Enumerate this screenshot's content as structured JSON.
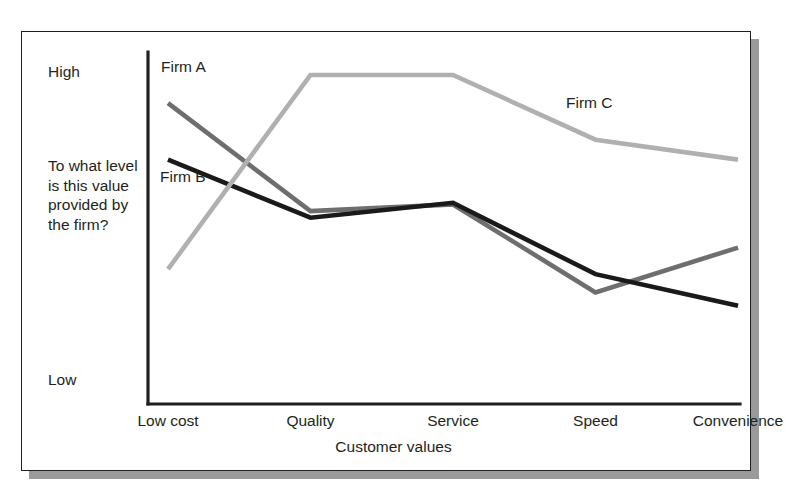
{
  "figure": {
    "background_color": "#ffffff",
    "frame_border_color": "#231f20",
    "frame_shadow_color": "#9a9a9a"
  },
  "chart_data": {
    "type": "line",
    "title": "",
    "subtitle": "",
    "xlabel": "Customer values",
    "ylabel": "To what level is this value provided by the firm?",
    "categories": [
      "Low cost",
      "Quality",
      "Service",
      "Speed",
      "Convenience"
    ],
    "y_tick_labels": [
      "High",
      "Low"
    ],
    "ylim": [
      0,
      10
    ],
    "grid": false,
    "legend_position": "inline-annotations",
    "series": [
      {
        "name": "Firm A",
        "color": "#6e6e6e",
        "label_position": "top-left",
        "values": [
          8.7,
          5.45,
          5.65,
          3.0,
          4.35
        ]
      },
      {
        "name": "Firm B",
        "color": "#1a1a1a",
        "label_position": "left",
        "values": [
          7.0,
          5.25,
          5.7,
          3.55,
          2.6
        ]
      },
      {
        "name": "Firm C",
        "color": "#b0b0b0",
        "label_position": "right",
        "values": [
          3.7,
          9.55,
          9.55,
          7.6,
          7.0
        ]
      }
    ]
  },
  "axis": {
    "high_label": "High",
    "low_label": "Low",
    "prompt_label": "To what level is this value provided by the firm?",
    "x_title": "Customer values",
    "categories": [
      {
        "label": "Low cost"
      },
      {
        "label": "Quality"
      },
      {
        "label": "Service"
      },
      {
        "label": "Speed"
      },
      {
        "label": "Convenience"
      }
    ]
  },
  "series_labels": {
    "firm_a": "Firm A",
    "firm_b": "Firm B",
    "firm_c": "Firm C"
  }
}
